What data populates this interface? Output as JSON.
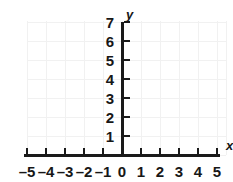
{
  "chart_data": {
    "type": "scatter",
    "title": "",
    "xlabel": "x",
    "ylabel": "y",
    "xlim": [
      -5,
      5
    ],
    "ylim": [
      0,
      7
    ],
    "grid": true,
    "legend": null,
    "series": [],
    "x_ticks": [
      {
        "value": -5,
        "label": "–5"
      },
      {
        "value": -4,
        "label": "–4"
      },
      {
        "value": -3,
        "label": "–3"
      },
      {
        "value": -2,
        "label": "–2"
      },
      {
        "value": -1,
        "label": "–1"
      },
      {
        "value": 0,
        "label": "0"
      },
      {
        "value": 1,
        "label": "1"
      },
      {
        "value": 2,
        "label": "2"
      },
      {
        "value": 3,
        "label": "3"
      },
      {
        "value": 4,
        "label": "4"
      },
      {
        "value": 5,
        "label": "5"
      }
    ],
    "y_ticks": [
      {
        "value": 1,
        "label": "1"
      },
      {
        "value": 2,
        "label": "2"
      },
      {
        "value": 3,
        "label": "3"
      },
      {
        "value": 4,
        "label": "4"
      },
      {
        "value": 5,
        "label": "5"
      },
      {
        "value": 6,
        "label": "6"
      },
      {
        "value": 7,
        "label": "7"
      }
    ],
    "colors": {
      "axis": "#1a1a1a",
      "grid": "#f1f1f1",
      "text": "#171717",
      "background": "#ffffff"
    }
  }
}
